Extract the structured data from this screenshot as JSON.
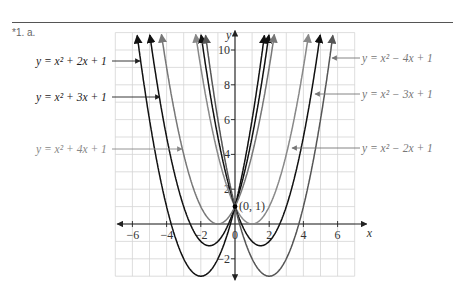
{
  "header": {
    "question": "*1. a."
  },
  "chart_data": {
    "type": "line",
    "title": "",
    "xlabel": "x",
    "ylabel": "y",
    "xlim": [
      -7,
      7
    ],
    "ylim": [
      -3,
      11
    ],
    "grid": true,
    "x_ticks": [
      -6,
      -4,
      -2,
      0,
      2,
      4,
      6
    ],
    "x_tick_labels": [
      "-6",
      "-4",
      "-2",
      "0",
      "2",
      "4",
      "6"
    ],
    "y_ticks": [
      -2,
      2,
      4,
      6,
      8,
      10
    ],
    "y_tick_labels": [
      "-2",
      "2",
      "4",
      "6",
      "8",
      "10"
    ],
    "annotations": [
      {
        "text": "(0, 1)",
        "x": 0,
        "y": 1
      }
    ],
    "series": [
      {
        "name": "y = x² + 4x + 1",
        "a": 1,
        "b": 4,
        "c": 1,
        "color": "#111111"
      },
      {
        "name": "y = x² + 3x + 1",
        "a": 1,
        "b": 3,
        "c": 1,
        "color": "#111111"
      },
      {
        "name": "y = x² + 2x + 1",
        "a": 1,
        "b": 2,
        "c": 1,
        "color": "#777777"
      },
      {
        "name": "y = x² − 2x + 1",
        "a": 1,
        "b": -2,
        "c": 1,
        "color": "#888888"
      },
      {
        "name": "y = x² − 3x + 1",
        "a": 1,
        "b": -3,
        "c": 1,
        "color": "#111111"
      },
      {
        "name": "y = x² − 4x + 1",
        "a": 1,
        "b": -4,
        "c": 1,
        "color": "#555555"
      }
    ],
    "legend_labels": [
      {
        "text": "y = x² + 2x + 1",
        "side": "left",
        "ty": 61,
        "color": "#222222",
        "arrow_to_x": 140
      },
      {
        "text": "y = x² + 3x + 1",
        "side": "left",
        "ty": 97,
        "color": "#222222",
        "arrow_to_x": 160
      },
      {
        "text": "y = x² + 4x + 1",
        "side": "left",
        "ty": 149,
        "color": "#888888",
        "arrow_to_x": 182
      },
      {
        "text": "y = x² − 4x + 1",
        "side": "right",
        "ty": 58,
        "color": "#777777",
        "arrow_to_x": 332
      },
      {
        "text": "y = x² − 3x + 1",
        "side": "right",
        "ty": 94,
        "color": "#777777",
        "arrow_to_x": 315
      },
      {
        "text": "y = x² − 2x + 1",
        "side": "right",
        "ty": 148,
        "color": "#777777",
        "arrow_to_x": 292
      }
    ]
  }
}
